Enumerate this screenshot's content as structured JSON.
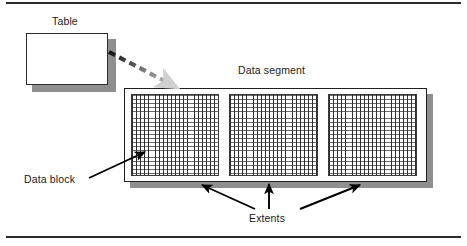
{
  "figure": {
    "background_color": "#ffffff",
    "rule_color": "#2b2b2b",
    "width": 467,
    "height": 246
  },
  "labels": {
    "table": "Table",
    "data_segment": "Data segment",
    "data_block": "Data block",
    "extents": "Extents"
  },
  "shapes": {
    "table_box": {
      "name": "table-box",
      "fill": "#ffffff",
      "stroke": "#2b2b2b",
      "shadow": "#8f8f8f"
    },
    "data_segment_box": {
      "name": "data-segment-box",
      "fill": "#ffffff",
      "stroke": "#1f1f1f",
      "shadow": "#8f8f8f"
    },
    "extents": [
      {
        "name": "extent-1",
        "grid_line_color": "#2f2f2f"
      },
      {
        "name": "extent-2",
        "grid_line_color": "#2f2f2f"
      },
      {
        "name": "extent-3",
        "grid_line_color": "#2f2f2f"
      }
    ]
  },
  "connectors": {
    "table_to_segment": {
      "name": "dashed-gradient-arrow",
      "style": "dashed",
      "from": "table-box",
      "to": "data-segment-box",
      "color_start": "#111111",
      "color_end": "#cfcfcf"
    },
    "data_block_pointer": {
      "name": "data-block-arrow",
      "style": "solid",
      "from": "data-block-label",
      "to": "extent-1",
      "color": "#000000"
    },
    "extent_pointers": {
      "name": "extents-arrows",
      "count": 3,
      "style": "solid",
      "from": "extents-label",
      "color": "#000000"
    }
  }
}
